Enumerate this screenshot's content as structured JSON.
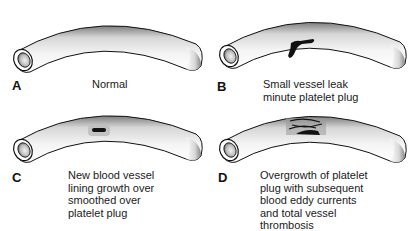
{
  "figure": {
    "panels": [
      {
        "id": "A",
        "letter": "A",
        "caption": "Normal",
        "lesion": "none"
      },
      {
        "id": "B",
        "letter": "B",
        "caption": "Small vessel leak\nminute platelet plug",
        "lesion": "platelet-plug-small"
      },
      {
        "id": "C",
        "letter": "C",
        "caption": "New blood vessel\nlining growth over\nsmoothed over\nplatelet plug",
        "lesion": "endothelialized-plug"
      },
      {
        "id": "D",
        "letter": "D",
        "caption": "Overgrowth of platelet\nplug with subsequent\nblood eddy currents\nand total vessel\nthrombosis",
        "lesion": "thrombosis-with-eddies"
      }
    ],
    "colors": {
      "ink": "#111111",
      "shade": "#9a9a9a",
      "background": "#ffffff"
    }
  }
}
